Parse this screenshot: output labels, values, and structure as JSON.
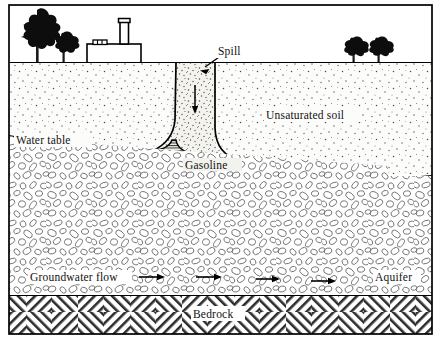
{
  "figure": {
    "frame_color": "#000000",
    "background_color": "#ffffff",
    "width": 441,
    "height": 342
  },
  "labels": {
    "spill": "Spill",
    "unsaturated_soil": "Unsaturated soil",
    "water_table": "Water table",
    "gasoline": "Gasoline",
    "groundwater_flow": "Groundwater flow",
    "aquifer": "Aquifer",
    "bedrock": "Bedrock"
  },
  "surface": {
    "trees_left": [
      "large-tree",
      "small-tree"
    ],
    "trees_right": [
      "small-tree",
      "small-tree"
    ],
    "building": "factory-building",
    "smokestack": "smokestack",
    "roof_vents": 3
  },
  "layers": [
    {
      "name": "surface-air",
      "label": "",
      "fill": "#ffffff"
    },
    {
      "name": "unsaturated-soil",
      "label": "Unsaturated soil",
      "fill": "#fbfbf8",
      "texture": "stipple"
    },
    {
      "name": "spill-plume",
      "label": "Spill",
      "fill": "#f2f1ec",
      "texture": "dense-stipple"
    },
    {
      "name": "gasoline-lens",
      "label": "Gasoline",
      "fill": "#efefe9",
      "texture": "horizontal-hatch"
    },
    {
      "name": "aquifer",
      "label": "Aquifer",
      "fill": "#ffffff",
      "texture": "gravel"
    },
    {
      "name": "bedrock",
      "label": "Bedrock",
      "fill": "#ffffff",
      "texture": "cross-hatch"
    }
  ],
  "annotations": {
    "spill_leader_arrow": "arrow-down-left",
    "infiltration_arrow": "arrow-down",
    "flow_arrows": 4,
    "flow_direction": "right"
  },
  "colors": {
    "ink": "#000000",
    "stipple": "#555555",
    "gravel_outline": "#6d6d6d",
    "hatch": "#3a3a3a",
    "paper": "#ffffff"
  }
}
